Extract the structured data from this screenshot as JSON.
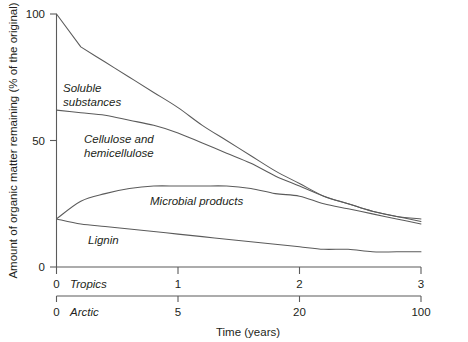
{
  "chart_data": {
    "type": "line",
    "title": "",
    "xlabel": "Time (years)",
    "ylabel": "Amount of organic matter remaining (% of the original)",
    "ylim": [
      0,
      100
    ],
    "yticks": [
      0,
      50,
      100
    ],
    "grid": false,
    "legend_position": "inline-labels",
    "axes": [
      {
        "name": "Tropics",
        "label": "Tropics",
        "ticks": [
          0,
          1,
          2,
          3
        ],
        "tick_labels": [
          "0",
          "1",
          "2",
          "3"
        ],
        "scale": "linear",
        "range": [
          0,
          3
        ]
      },
      {
        "name": "Arctic",
        "label": "Arctic",
        "ticks": [
          0,
          5,
          20,
          100
        ],
        "tick_labels": [
          "0",
          "5",
          "20",
          "100"
        ],
        "scale": "nonlinear",
        "range": [
          0,
          100
        ]
      }
    ],
    "x": [
      0,
      0.2,
      0.4,
      0.6,
      0.8,
      1.0,
      1.2,
      1.4,
      1.6,
      1.8,
      2.0,
      2.2,
      2.4,
      2.6,
      2.8,
      3.0
    ],
    "series": [
      {
        "name": "Soluble substances",
        "values": [
          100,
          87,
          81,
          75,
          69,
          63,
          56,
          50,
          44,
          38,
          33,
          28,
          25,
          22,
          20,
          19
        ]
      },
      {
        "name": "Cellulose and hemicellulose",
        "values": [
          62,
          61,
          60,
          58,
          56,
          53,
          49,
          45,
          41,
          36,
          32,
          28,
          25,
          22,
          20,
          18
        ]
      },
      {
        "name": "Microbial products",
        "values": [
          19,
          26,
          29,
          31,
          32,
          32,
          32,
          32,
          31,
          29,
          28,
          25,
          23,
          21,
          19,
          17
        ]
      },
      {
        "name": "Lignin",
        "values": [
          19,
          17,
          16,
          15,
          14,
          13,
          12,
          11,
          10,
          9,
          8,
          7,
          7,
          6,
          6,
          6
        ]
      }
    ],
    "annotations": [
      {
        "text": "Soluble substances",
        "lines": [
          "Soluble",
          "substances"
        ]
      },
      {
        "text": "Cellulose and hemicellulose",
        "lines": [
          "Cellulose and",
          "hemicellulose"
        ]
      },
      {
        "text": "Microbial products",
        "lines": [
          "Microbial products"
        ]
      },
      {
        "text": "Lignin",
        "lines": [
          "Lignin"
        ]
      }
    ],
    "colors": {
      "curve": "#5b5b5b",
      "axis": "#5b5b5b",
      "text": "#231f20",
      "background": "#ffffff"
    }
  },
  "yaxis": {
    "title": "Amount of organic matter remaining (% of the original)",
    "tick_100": "100",
    "tick_50": "50",
    "tick_0": "0"
  },
  "xaxis": {
    "title": "Time (years)",
    "tropics": {
      "label": "Tropics",
      "t0": "0",
      "t1": "1",
      "t2": "2",
      "t3": "3"
    },
    "arctic": {
      "label": "Arctic",
      "t0": "0",
      "t1": "5",
      "t2": "20",
      "t3": "100"
    }
  },
  "labels": {
    "soluble_line1": "Soluble",
    "soluble_line2": "substances",
    "cellulose_line1": "Cellulose and",
    "cellulose_line2": "hemicellulose",
    "microbial": "Microbial products",
    "lignin": "Lignin"
  }
}
